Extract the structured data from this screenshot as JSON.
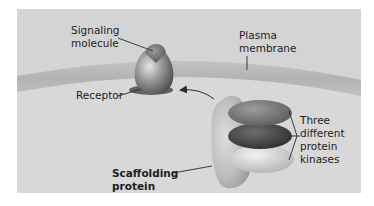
{
  "diagram": {
    "type": "biology-schematic",
    "topic": "scaffolding protein with protein kinases at plasma membrane",
    "colors": {
      "background": "#ffffff",
      "panel": "#d4d4d4",
      "membrane": "#b7b7b7",
      "membrane_light": "#c4c4c4",
      "leader_line": "#2a2a2a",
      "text": "#1e1e1e"
    },
    "labels": {
      "signaling_molecule_line1": "Signaling",
      "signaling_molecule_line2": "molecule",
      "plasma_membrane_line1": "Plasma",
      "plasma_membrane_line2": "membrane",
      "receptor": "Receptor",
      "kinases_line1": "Three",
      "kinases_line2": "different",
      "kinases_line3": "protein",
      "kinases_line4": "kinases",
      "scaffolding_line1": "Scaffolding",
      "scaffolding_line2": "protein"
    },
    "components": [
      {
        "name": "Signaling molecule",
        "shape": "small cone atop receptor"
      },
      {
        "name": "Receptor",
        "shape": "egg-shaped, embedded in membrane"
      },
      {
        "name": "Plasma membrane",
        "shape": "curved horizontal band"
      },
      {
        "name": "Scaffolding protein",
        "shape": "tall oval, light gray"
      },
      {
        "name": "Protein kinase 1",
        "shape": "ellipse, medium gray (top)"
      },
      {
        "name": "Protein kinase 2",
        "shape": "ellipse, dark gray (middle)"
      },
      {
        "name": "Protein kinase 3",
        "shape": "ellipse, light gray (bottom)"
      }
    ],
    "arrows": [
      {
        "from": "Scaffolding protein",
        "to": "Receptor",
        "style": "curved"
      }
    ]
  }
}
